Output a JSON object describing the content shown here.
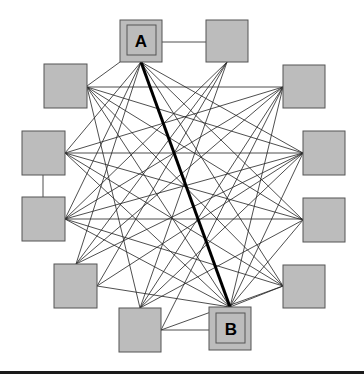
{
  "diagram": {
    "type": "network-graph",
    "nodes": [
      {
        "id": "A",
        "label": "A",
        "x": 120,
        "y": 20,
        "w": 42,
        "h": 42,
        "highlighted": true
      },
      {
        "id": "N1",
        "label": "",
        "x": 206,
        "y": 20,
        "w": 42,
        "h": 42
      },
      {
        "id": "N2",
        "label": "",
        "x": 283,
        "y": 65,
        "w": 42,
        "h": 43
      },
      {
        "id": "N3",
        "label": "",
        "x": 303,
        "y": 131,
        "w": 42,
        "h": 44
      },
      {
        "id": "N4",
        "label": "",
        "x": 303,
        "y": 198,
        "w": 42,
        "h": 44
      },
      {
        "id": "N5",
        "label": "",
        "x": 283,
        "y": 265,
        "w": 42,
        "h": 43
      },
      {
        "id": "B",
        "label": "B",
        "x": 209,
        "y": 307,
        "w": 42,
        "h": 43,
        "highlighted": true
      },
      {
        "id": "N6",
        "label": "",
        "x": 119,
        "y": 308,
        "w": 42,
        "h": 44
      },
      {
        "id": "N7",
        "label": "",
        "x": 54,
        "y": 264,
        "w": 43,
        "h": 44
      },
      {
        "id": "N8",
        "label": "",
        "x": 22,
        "y": 197,
        "w": 43,
        "h": 44
      },
      {
        "id": "N9",
        "label": "",
        "x": 22,
        "y": 131,
        "w": 43,
        "h": 44
      },
      {
        "id": "N10",
        "label": "",
        "x": 44,
        "y": 64,
        "w": 43,
        "h": 44
      }
    ],
    "highlighted_edge": {
      "from": "A",
      "to": "B"
    },
    "colors": {
      "node_fill": "#bcbcbc",
      "node_stroke": "#555555",
      "edge": "#222222",
      "highlight_edge": "#000000"
    }
  }
}
